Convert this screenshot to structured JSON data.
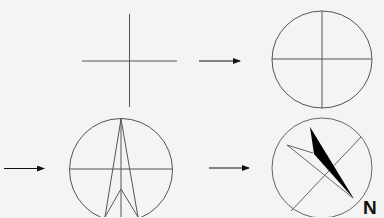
{
  "diagram": {
    "colors": {
      "background": "#f4f4f2",
      "stroke": "#555555",
      "arrow": "#111111",
      "needle_fill": "#000000"
    },
    "steps": [
      {
        "id": 1,
        "description": "Draw a cross (horizontal and vertical lines)"
      },
      {
        "id": 2,
        "description": "Draw a circle around the cross"
      },
      {
        "id": 3,
        "description": "Draw a tall arrow/needle shape inside the circle"
      },
      {
        "id": 4,
        "description": "Rotate and fill one half of the needle black"
      }
    ],
    "arrows": [
      {
        "from_step": 1,
        "to_step": 2
      },
      {
        "from_step": 2,
        "to_step": 3
      },
      {
        "from_step": 3,
        "to_step": 4
      }
    ],
    "labels": {
      "north": "N"
    }
  }
}
